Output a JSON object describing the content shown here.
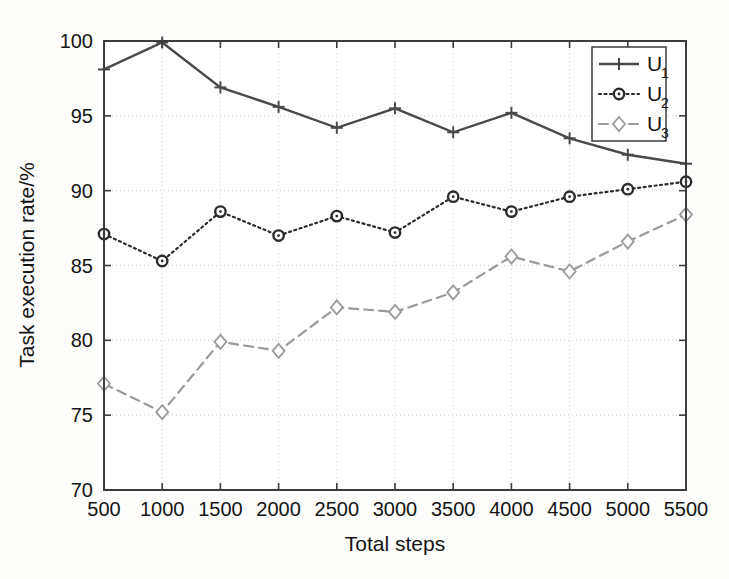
{
  "chart_data": {
    "type": "line",
    "title": "",
    "xlabel": "Total steps",
    "ylabel": "Task execution rate/%",
    "categories": [
      500,
      1000,
      1500,
      2000,
      2500,
      3000,
      3500,
      4000,
      4500,
      5000,
      5500
    ],
    "x": [
      500,
      1000,
      1500,
      2000,
      2500,
      3000,
      3500,
      4000,
      4500,
      5000,
      5500
    ],
    "xlim": [
      500,
      5500
    ],
    "ylim": [
      70,
      100
    ],
    "xticks": [
      "500",
      "1000",
      "1500",
      "2000",
      "2500",
      "3000",
      "3500",
      "4000",
      "4500",
      "5000",
      "5500"
    ],
    "yticks": [
      "70",
      "75",
      "80",
      "85",
      "90",
      "95",
      "100"
    ],
    "grid": true,
    "legend_position": "upper right",
    "series": [
      {
        "name": "U1",
        "label": "U",
        "subscript": "1",
        "marker": "plus",
        "linestyle": "solid",
        "color": "#4a4a4a",
        "values": [
          98.1,
          99.9,
          96.9,
          95.6,
          94.2,
          95.5,
          93.9,
          95.2,
          93.5,
          92.4,
          91.8
        ]
      },
      {
        "name": "U2",
        "label": "U",
        "subscript": "2",
        "marker": "circle",
        "linestyle": "dotted",
        "color": "#2b2b2b",
        "values": [
          87.1,
          85.3,
          88.6,
          87.0,
          88.3,
          87.2,
          89.6,
          88.6,
          89.6,
          90.1,
          90.6
        ]
      },
      {
        "name": "U3",
        "label": "U",
        "subscript": "3",
        "marker": "diamond",
        "linestyle": "dashed",
        "color": "#9a9a9a",
        "values": [
          77.1,
          75.2,
          79.9,
          79.3,
          82.2,
          81.9,
          83.2,
          85.6,
          84.6,
          86.6,
          88.4
        ]
      }
    ]
  },
  "legend": {
    "entries": [
      {
        "label": "U",
        "subscript": "1"
      },
      {
        "label": "U",
        "subscript": "2"
      },
      {
        "label": "U",
        "subscript": "3"
      }
    ]
  },
  "axes": {
    "x_title": "Total steps",
    "y_title": "Task execution rate/%"
  }
}
